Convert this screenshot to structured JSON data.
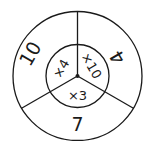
{
  "diagram": {
    "type": "concentric-circle-sectors",
    "outer_ring": [
      {
        "label": "10",
        "position": "upper-left"
      },
      {
        "label": "4",
        "position": "upper-right"
      },
      {
        "label": "7",
        "position": "bottom"
      }
    ],
    "inner_circle": [
      {
        "label": "×4",
        "position": "left"
      },
      {
        "label": "×10",
        "position": "right"
      },
      {
        "label": "×3",
        "position": "bottom"
      }
    ],
    "colors": {
      "stroke": "#1a1a1a",
      "background": "#ffffff"
    }
  }
}
